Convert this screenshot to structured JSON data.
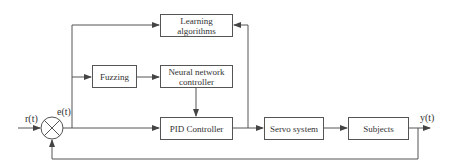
{
  "blocks": {
    "learning": "Learning algorithms",
    "fuzzing": "Fuzzing",
    "neural": "Neural network controller",
    "pid": "PID Controller",
    "servo": "Servo system",
    "subjects": "Subjects"
  },
  "signals": {
    "input": "r(t)",
    "error": "e(t)",
    "output": "y(t)"
  },
  "colors": {
    "line": "#555555",
    "text": "#333333",
    "background": "#ffffff"
  }
}
